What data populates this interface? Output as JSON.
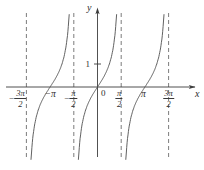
{
  "figure": {
    "background": "#ffffff"
  },
  "chart_data": {
    "type": "line",
    "expression": "y = tan(x)",
    "title": "",
    "xlabel": "x",
    "ylabel": "y",
    "origin_label": "0",
    "grid": false,
    "legend": null,
    "xlim_over_pi": [
      -1.9,
      2.05
    ],
    "ylim": [
      -3.15,
      3.15
    ],
    "period_over_pi": 1,
    "zeros_over_pi": [
      -1,
      0,
      1
    ],
    "asymptotes_over_pi": [
      -1.5,
      -0.5,
      0.5,
      1.5
    ],
    "branch_domains_over_pi": [
      [
        -1.5,
        -0.5
      ],
      [
        -0.5,
        0.5
      ],
      [
        0.5,
        1.5
      ]
    ],
    "x_ticks": [
      {
        "id": "neg-3pi-2",
        "pos_over_pi": -1.5,
        "style": "fraction",
        "sign": "−",
        "num": "3π",
        "den": "2"
      },
      {
        "id": "neg-pi",
        "pos_over_pi": -1.0,
        "style": "plain",
        "text": "−π"
      },
      {
        "id": "neg-pi-2",
        "pos_over_pi": -0.5,
        "style": "fraction",
        "sign": "−",
        "num": "π",
        "den": "2"
      },
      {
        "id": "pi-2",
        "pos_over_pi": 0.5,
        "style": "fraction",
        "sign": "",
        "num": "π",
        "den": "2"
      },
      {
        "id": "pi",
        "pos_over_pi": 1.0,
        "style": "plain",
        "text": "π"
      },
      {
        "id": "3pi-2",
        "pos_over_pi": 1.5,
        "style": "fraction",
        "sign": "",
        "num": "3π",
        "den": "2"
      }
    ],
    "y_ticks": [
      {
        "label": "1",
        "value": 1
      }
    ],
    "colors": {
      "curve": "#4f4f4f",
      "axis": "#3d3d3d",
      "asymptote": "#5a5a5a",
      "text": "#2e2e2e"
    }
  }
}
